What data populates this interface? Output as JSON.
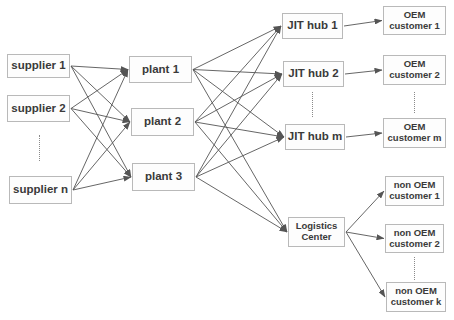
{
  "diagram": {
    "type": "supply-chain-network",
    "colors": {
      "box_border": "#b9b9b9",
      "text": "#3a3a3a",
      "edge": "#555555",
      "background": "#ffffff"
    },
    "nodes": [
      {
        "id": "s1",
        "label": "supplier 1",
        "tier": "supplier",
        "x": 7,
        "y": 54,
        "w": 63,
        "h": 24,
        "size": "big"
      },
      {
        "id": "s2",
        "label": "supplier 2",
        "tier": "supplier",
        "x": 7,
        "y": 95,
        "w": 63,
        "h": 27,
        "size": "big"
      },
      {
        "id": "sn",
        "label": "supplier n",
        "tier": "supplier",
        "x": 9,
        "y": 176,
        "w": 63,
        "h": 28,
        "size": "big"
      },
      {
        "id": "p1",
        "label": "plant 1",
        "tier": "plant",
        "x": 129,
        "y": 56,
        "w": 63,
        "h": 27,
        "size": "big"
      },
      {
        "id": "p2",
        "label": "plant 2",
        "tier": "plant",
        "x": 131,
        "y": 108,
        "w": 63,
        "h": 28,
        "size": "big"
      },
      {
        "id": "p3",
        "label": "plant 3",
        "tier": "plant",
        "x": 132,
        "y": 163,
        "w": 63,
        "h": 28,
        "size": "big"
      },
      {
        "id": "j1",
        "label": "JIT hub 1",
        "tier": "jit-hub",
        "x": 282,
        "y": 13,
        "w": 61,
        "h": 26,
        "size": "big"
      },
      {
        "id": "j2",
        "label": "JIT hub 2",
        "tier": "jit-hub",
        "x": 283,
        "y": 61,
        "w": 61,
        "h": 26,
        "size": "big"
      },
      {
        "id": "jm",
        "label": "JIT hub m",
        "tier": "jit-hub",
        "x": 285,
        "y": 124,
        "w": 60,
        "h": 26,
        "size": "big"
      },
      {
        "id": "lc",
        "label": "Logistics\nCenter",
        "tier": "logistics-center",
        "x": 288,
        "y": 217,
        "w": 57,
        "h": 30,
        "size": "small"
      },
      {
        "id": "o1",
        "label": "OEM\ncustomer 1",
        "tier": "oem-customer",
        "x": 383,
        "y": 6,
        "w": 63,
        "h": 29,
        "size": "small"
      },
      {
        "id": "o2",
        "label": "OEM\ncustomer 2",
        "tier": "oem-customer",
        "x": 383,
        "y": 55,
        "w": 63,
        "h": 30,
        "size": "small"
      },
      {
        "id": "om",
        "label": "OEM\ncustomer m",
        "tier": "oem-customer",
        "x": 383,
        "y": 118,
        "w": 63,
        "h": 30,
        "size": "small"
      },
      {
        "id": "n1",
        "label": "non OEM\ncustomer 1",
        "tier": "non-oem-customer",
        "x": 385,
        "y": 176,
        "w": 59,
        "h": 30,
        "size": "small"
      },
      {
        "id": "n2",
        "label": "non OEM\ncustomer 2",
        "tier": "non-oem-customer",
        "x": 385,
        "y": 224,
        "w": 59,
        "h": 29,
        "size": "small"
      },
      {
        "id": "nk",
        "label": "non OEM\ncustomer k",
        "tier": "non-oem-customer",
        "x": 386,
        "y": 282,
        "w": 60,
        "h": 30,
        "size": "small"
      }
    ],
    "ellipses": [
      {
        "id": "supplier-ellipsis",
        "x": 39,
        "y1": 135,
        "y2": 161
      },
      {
        "id": "jit-hub-ellipsis",
        "x": 312,
        "y1": 92,
        "y2": 117
      },
      {
        "id": "oem-customer-ellipsis",
        "x": 414,
        "y1": 92,
        "y2": 113
      },
      {
        "id": "non-oem-customer-ellipsis",
        "x": 414,
        "y1": 257,
        "y2": 280
      }
    ],
    "edges": [
      [
        "s1",
        "p1"
      ],
      [
        "s1",
        "p2"
      ],
      [
        "s1",
        "p3"
      ],
      [
        "s2",
        "p1"
      ],
      [
        "s2",
        "p2"
      ],
      [
        "s2",
        "p3"
      ],
      [
        "sn",
        "p1"
      ],
      [
        "sn",
        "p2"
      ],
      [
        "sn",
        "p3"
      ],
      [
        "p1",
        "j1"
      ],
      [
        "p1",
        "j2"
      ],
      [
        "p1",
        "jm"
      ],
      [
        "p1",
        "lc"
      ],
      [
        "p2",
        "j1"
      ],
      [
        "p2",
        "j2"
      ],
      [
        "p2",
        "jm"
      ],
      [
        "p2",
        "lc"
      ],
      [
        "p3",
        "j1"
      ],
      [
        "p3",
        "j2"
      ],
      [
        "p3",
        "jm"
      ],
      [
        "p3",
        "lc"
      ],
      [
        "j1",
        "o1"
      ],
      [
        "j2",
        "o2"
      ],
      [
        "jm",
        "om"
      ],
      [
        "lc",
        "n1"
      ],
      [
        "lc",
        "n2"
      ],
      [
        "lc",
        "nk"
      ]
    ]
  }
}
